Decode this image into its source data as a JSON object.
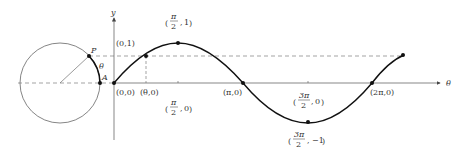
{
  "diagram": {
    "axes": {
      "x_label": "θ",
      "y_label": "y"
    },
    "circle": {
      "point_P_label": "P",
      "point_A_label": "A",
      "arc_label": "θ"
    },
    "points": [
      {
        "label": "(0,1)"
      },
      {
        "label": "(0,0)"
      },
      {
        "label": "(θ,0)"
      },
      {
        "label": "(π,0)"
      },
      {
        "label": "(2π,0)"
      }
    ],
    "frac_points": {
      "peak": {
        "num": "π",
        "den": "2",
        "val": "1"
      },
      "half_pi_axis": {
        "num": "π",
        "den": "2",
        "val": "0"
      },
      "three_half_axis": {
        "num": "3π",
        "den": "2",
        "val": "0"
      },
      "trough": {
        "num": "3π",
        "den": "2",
        "val": "−1"
      }
    },
    "colors": {
      "curve": "#1a1a1a",
      "axis": "#555555",
      "dashed": "#555555",
      "text": "#333333"
    }
  }
}
